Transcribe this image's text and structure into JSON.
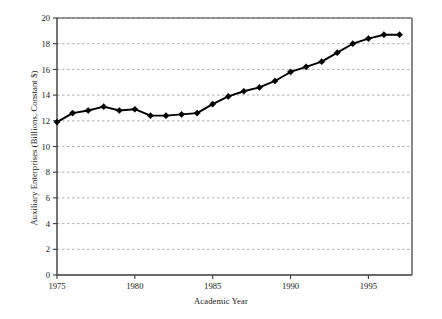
{
  "chart_data": {
    "type": "line",
    "title": "",
    "xlabel": "Academic Year",
    "ylabel": "Auxiliary Enterprises (Billions, Constant $)",
    "xlim": [
      1975,
      1997.8
    ],
    "ylim": [
      0,
      20
    ],
    "xticks": [
      1975,
      1980,
      1985,
      1990,
      1995
    ],
    "xtick_labels": [
      "1975",
      "1980",
      "1985",
      "1990",
      "1995"
    ],
    "yticks": [
      0,
      2,
      4,
      6,
      8,
      10,
      12,
      14,
      16,
      18,
      20
    ],
    "ytick_labels": [
      "0",
      "2",
      "4",
      "6",
      "8",
      "10",
      "12",
      "14",
      "16",
      "18",
      "20"
    ],
    "grid": "horizontal-dashed",
    "legend": "none",
    "marker": "diamond",
    "line_color": "#000000",
    "marker_color": "#000000",
    "grid_color": "#9a9a9a",
    "axis_color": "#3a3a3a",
    "background": "#ffffff",
    "x": [
      1975,
      1976,
      1977,
      1978,
      1979,
      1980,
      1981,
      1982,
      1983,
      1984,
      1985,
      1986,
      1987,
      1988,
      1989,
      1990,
      1991,
      1992,
      1993,
      1994,
      1995,
      1996,
      1997
    ],
    "series": [
      {
        "name": "Auxiliary Enterprises",
        "values": [
          11.9,
          12.6,
          12.8,
          13.1,
          12.8,
          12.9,
          12.4,
          12.4,
          12.5,
          12.6,
          13.3,
          13.9,
          14.3,
          14.6,
          15.1,
          15.8,
          16.2,
          16.6,
          17.3,
          18.0,
          18.4,
          18.7,
          18.7
        ]
      }
    ]
  },
  "figure": {
    "x_axis_title": "Academic Year",
    "y_axis_title": "Auxiliary Enterprises (Billions, Constant $)"
  }
}
